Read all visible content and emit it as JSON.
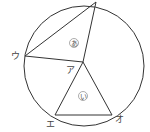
{
  "diagram": {
    "points": {
      "center": "ア",
      "left": "ウ",
      "bottom_left": "エ",
      "bottom_right": "オ"
    },
    "regions": {
      "upper": "あ",
      "lower": "い"
    }
  }
}
